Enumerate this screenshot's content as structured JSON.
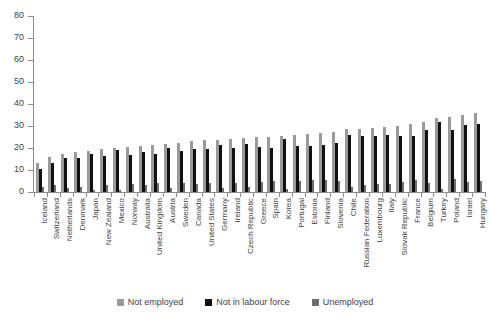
{
  "chart_data": {
    "type": "bar",
    "title": "",
    "subtitle": "",
    "xlabel": "",
    "ylabel": "",
    "ylim": [
      0,
      80
    ],
    "yticks": [
      0,
      10,
      20,
      30,
      40,
      50,
      60,
      70,
      80
    ],
    "grid": false,
    "legend_position": "bottom",
    "categories": [
      "Iceland",
      "Switzerland",
      "Netherlands",
      "Denmark",
      "Japan",
      "New Zealand",
      "Mexico",
      "Norway",
      "Australia",
      "United Kingdom",
      "Austria",
      "Sweden",
      "Canada",
      "United States",
      "Germany",
      "Ireland",
      "Czech Republic",
      "Greece",
      "Spain",
      "Korea",
      "Portugal",
      "Estonia",
      "Finland",
      "Slovenia",
      "Chile",
      "Russian Federation",
      "Luxembourg",
      "Italy",
      "Slovak Republic",
      "France",
      "Belgium",
      "Turkey",
      "Poland",
      "Israel",
      "Hungary"
    ],
    "series": [
      {
        "name": "Not employed",
        "color": "#9a9a9a",
        "values": [
          13.0,
          16.0,
          17.5,
          18.0,
          18.5,
          19.5,
          20.0,
          20.5,
          21.0,
          21.5,
          22.0,
          22.5,
          23.0,
          23.5,
          23.5,
          24.0,
          24.5,
          25.0,
          25.0,
          25.5,
          26.0,
          26.5,
          27.0,
          27.5,
          28.5,
          28.5,
          29.0,
          29.5,
          30.0,
          31.0,
          32.0,
          33.5,
          34.0,
          35.0,
          36.0
        ]
      },
      {
        "name": "Not in labour force",
        "color": "#111111",
        "values": [
          10.5,
          13.0,
          15.5,
          15.5,
          17.5,
          16.5,
          19.0,
          17.0,
          18.0,
          17.5,
          20.0,
          18.5,
          19.5,
          19.5,
          21.5,
          20.0,
          22.0,
          20.5,
          20.0,
          24.0,
          21.0,
          21.0,
          21.5,
          22.5,
          26.0,
          25.5,
          25.5,
          26.0,
          25.5,
          25.5,
          28.0,
          32.0,
          28.0,
          30.5,
          31.0
        ]
      },
      {
        "name": "Unemployed",
        "color": "#6e6e6e",
        "values": [
          2.5,
          3.0,
          2.0,
          2.5,
          1.0,
          3.0,
          1.0,
          3.5,
          3.0,
          4.0,
          2.0,
          4.0,
          3.5,
          4.0,
          2.0,
          4.0,
          2.5,
          4.5,
          5.0,
          1.5,
          5.0,
          5.5,
          5.5,
          5.0,
          2.5,
          3.0,
          3.5,
          3.5,
          4.5,
          5.5,
          4.0,
          1.5,
          6.0,
          4.5,
          5.0
        ]
      }
    ],
    "legend": [
      {
        "label": "Not employed",
        "color": "#9a9a9a"
      },
      {
        "label": "Not in labour force",
        "color": "#111111"
      },
      {
        "label": "Unemployed",
        "color": "#6e6e6e"
      }
    ]
  }
}
